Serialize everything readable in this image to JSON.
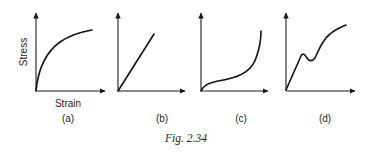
{
  "figure": {
    "caption": "Fig. 2.34",
    "y_axis_label": "Stress",
    "x_axis_label": "Strain",
    "panels": [
      {
        "id": "a",
        "label": "(a)",
        "shape": "concave-down rising curve (yielding/softening)"
      },
      {
        "id": "b",
        "label": "(b)",
        "shape": "straight line (linear elastic)"
      },
      {
        "id": "c",
        "label": "(c)",
        "shape": "S-shaped rising curve, steep at end (stiffening)"
      },
      {
        "id": "d",
        "label": "(d)",
        "shape": "linear rise, local peak and dip (yield point), then rising concave-down curve"
      }
    ]
  }
}
